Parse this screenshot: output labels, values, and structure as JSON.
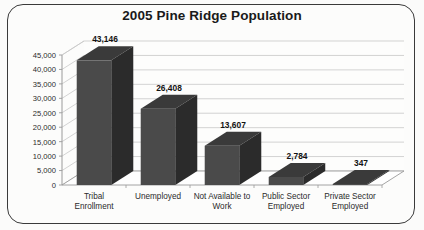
{
  "chart_data": {
    "type": "bar",
    "title": "2005 Pine Ridge Population",
    "xlabel": "",
    "ylabel": "",
    "categories": [
      "Tribal Enrollment",
      "Unemployed",
      "Not Available to Work",
      "Public Sector Employed",
      "Private Sector Employed"
    ],
    "category_lines": [
      [
        "Tribal",
        "Enrollment"
      ],
      [
        "Unemployed",
        ""
      ],
      [
        "Not Available to",
        "Work"
      ],
      [
        "Public Sector",
        "Employed"
      ],
      [
        "Private Sector",
        "Employed"
      ]
    ],
    "values": [
      43146,
      26408,
      13607,
      2784,
      347
    ],
    "value_labels": [
      "43,146",
      "26,408",
      "13,607",
      "2,784",
      "347"
    ],
    "ylim": [
      0,
      45000
    ],
    "ytick_values": [
      0,
      5000,
      10000,
      15000,
      20000,
      25000,
      30000,
      35000,
      40000,
      45000
    ],
    "ytick_labels": [
      "0",
      "5,000",
      "10,000",
      "15,000",
      "20,000",
      "25,000",
      "30,000",
      "35,000",
      "40,000",
      "45,000"
    ],
    "grid": true,
    "legend": "none",
    "style": "3d-column",
    "colors": {
      "bar_front": "#4a4a4a",
      "bar_top": "#3a3a3a",
      "bar_side": "#2b2b2b",
      "gridline": "#c8c8c8",
      "axis": "#9a9a9a",
      "background": "#fcfcfb",
      "border": "#3a3a3a",
      "text": "#1a1a1a"
    }
  }
}
